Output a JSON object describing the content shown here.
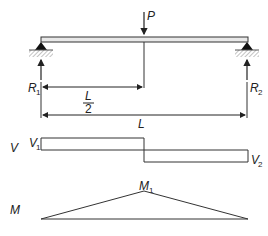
{
  "diagram": {
    "type": "simply supported beam with central point load",
    "labels": {
      "load": "P",
      "reaction_left": "R",
      "reaction_left_sub": "1",
      "reaction_right": "R",
      "reaction_right_sub": "2",
      "half_span_num": "L",
      "half_span_den": "2",
      "span": "L",
      "shear_axis": "V",
      "shear_left": "V",
      "shear_left_sub": "1",
      "shear_right": "V",
      "shear_right_sub": "2",
      "moment_axis": "M",
      "moment_max": "M",
      "moment_max_sub": "1"
    },
    "colors": {
      "line": "#333333",
      "beam_fill": "#e8e8e8",
      "hatch": "#888888"
    }
  }
}
